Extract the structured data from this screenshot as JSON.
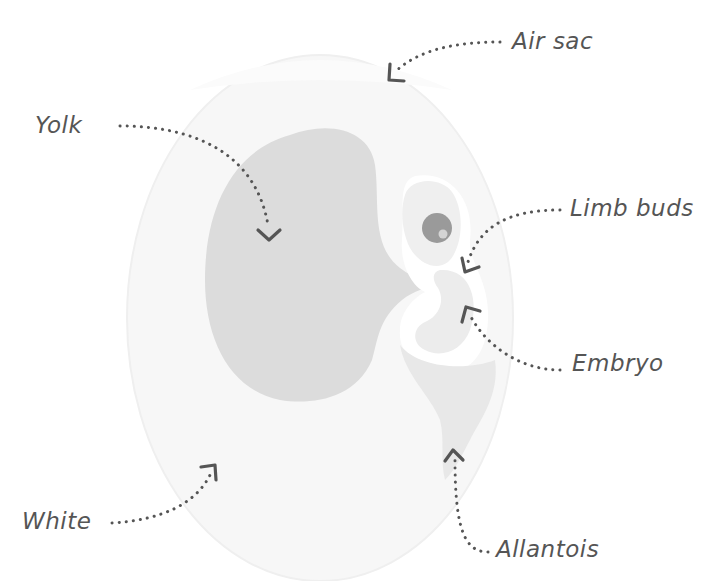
{
  "diagram": {
    "colors": {
      "background": "#ffffff",
      "egg_white": "#f7f7f7",
      "egg_outline": "#f0f0f0",
      "air_sac": "#fafafa",
      "yolk": "#dcdcdc",
      "embryo_light": "#f0f0f0",
      "embryo_mid": "#e6e6e6",
      "allantois": "#e8e8e8",
      "eye_outer": "#9a9a9a",
      "eye_highlight": "#d4d4d4",
      "label_text": "#555555",
      "arrow": "#555555"
    },
    "labels": {
      "air_sac": "Air sac",
      "yolk": "Yolk",
      "limb_buds": "Limb buds",
      "embryo": "Embryo",
      "white": "White",
      "allantois": "Allantois"
    }
  }
}
